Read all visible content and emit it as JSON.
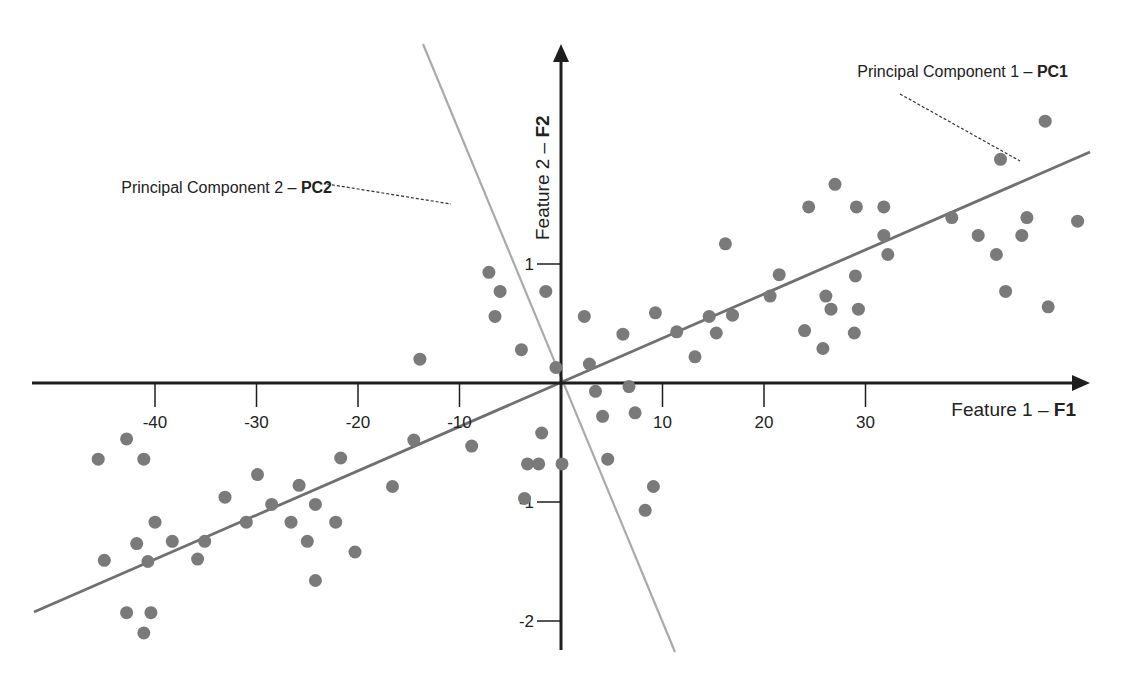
{
  "chart_data": {
    "type": "scatter",
    "title": "",
    "xlabel": "Feature 1 – F1",
    "xlabel_plain": "Feature 1 – ",
    "xlabel_bold": "F1",
    "ylabel": "Feature 2 – F2",
    "ylabel_plain": "Feature 2 – ",
    "ylabel_bold": "F2",
    "x_ticks": [
      -40,
      -30,
      -20,
      -10,
      10,
      20,
      30
    ],
    "x_tick_labels": [
      "-40",
      "-30",
      "-20",
      "-10",
      "10",
      "20",
      "30"
    ],
    "y_ticks": [
      1,
      -1,
      -2
    ],
    "y_tick_labels": [
      "1",
      "-1",
      "-2"
    ],
    "xlim": [
      -52,
      52
    ],
    "ylim": [
      -2.3,
      2.8
    ],
    "grid": false,
    "legend": null,
    "annotations": [
      {
        "text": "Principal Component 1 – PC1",
        "plain": "Principal Component 1 – ",
        "bold": "PC1",
        "points_to": "PC1 line, upper right"
      },
      {
        "text": "Principal Component 2 – PC2",
        "plain": "Principal Component 2 – ",
        "bold": "PC2",
        "points_to": "PC2 line, upper left"
      }
    ],
    "lines": [
      {
        "name": "PC1",
        "slope_per_unit": 0.04,
        "from": [
          -52,
          -1.9
        ],
        "to": [
          52,
          1.9
        ],
        "color": "#6e6e6e"
      },
      {
        "name": "PC2",
        "from": [
          -18.2,
          2.85
        ],
        "to": [
          10.8,
          -2.3
        ],
        "color": "#a8a8a8"
      }
    ],
    "series": [
      {
        "name": "samples",
        "color": "#7a7a7a",
        "points": [
          [
            -45.6,
            -0.64
          ],
          [
            -42.8,
            -0.47
          ],
          [
            -41.1,
            -0.64
          ],
          [
            -45.0,
            -1.49
          ],
          [
            -41.8,
            -1.35
          ],
          [
            -40.0,
            -1.17
          ],
          [
            -38.3,
            -1.33
          ],
          [
            -35.8,
            -1.48
          ],
          [
            -35.1,
            -1.33
          ],
          [
            -40.7,
            -1.5
          ],
          [
            -42.8,
            -1.93
          ],
          [
            -40.4,
            -1.93
          ],
          [
            -41.1,
            -2.1
          ],
          [
            -33.1,
            -0.96
          ],
          [
            -31.0,
            -1.17
          ],
          [
            -29.9,
            -0.77
          ],
          [
            -28.5,
            -1.02
          ],
          [
            -26.6,
            -1.17
          ],
          [
            -25.8,
            -0.86
          ],
          [
            -25.0,
            -1.33
          ],
          [
            -24.2,
            -1.02
          ],
          [
            -24.2,
            -1.66
          ],
          [
            -22.2,
            -1.17
          ],
          [
            -21.7,
            -0.63
          ],
          [
            -20.3,
            -1.42
          ],
          [
            -16.6,
            -0.87
          ],
          [
            -14.5,
            -0.48
          ],
          [
            -13.9,
            0.2
          ],
          [
            -8.8,
            -0.53
          ],
          [
            -7.1,
            0.93
          ],
          [
            -6.0,
            0.77
          ],
          [
            -6.5,
            0.56
          ],
          [
            -3.6,
            -0.97
          ],
          [
            -3.3,
            -0.68
          ],
          [
            -3.9,
            0.28
          ],
          [
            -1.5,
            0.77
          ],
          [
            -0.5,
            0.13
          ],
          [
            -1.9,
            -0.42
          ],
          [
            -2.2,
            -0.68
          ],
          [
            0.1,
            -0.68
          ],
          [
            2.3,
            0.56
          ],
          [
            2.8,
            0.16
          ],
          [
            3.4,
            -0.07
          ],
          [
            4.1,
            -0.28
          ],
          [
            4.6,
            -0.64
          ],
          [
            6.1,
            0.41
          ],
          [
            6.7,
            -0.03
          ],
          [
            7.3,
            -0.25
          ],
          [
            8.3,
            -1.07
          ],
          [
            9.1,
            -0.87
          ],
          [
            9.3,
            0.59
          ],
          [
            11.4,
            0.43
          ],
          [
            13.2,
            0.22
          ],
          [
            14.6,
            0.56
          ],
          [
            15.3,
            0.42
          ],
          [
            16.2,
            1.17
          ],
          [
            16.9,
            0.57
          ],
          [
            20.6,
            0.73
          ],
          [
            21.5,
            0.91
          ],
          [
            24.0,
            0.44
          ],
          [
            24.4,
            1.48
          ],
          [
            25.8,
            0.29
          ],
          [
            26.1,
            0.73
          ],
          [
            26.6,
            0.62
          ],
          [
            27.0,
            1.67
          ],
          [
            28.9,
            0.42
          ],
          [
            29.1,
            1.48
          ],
          [
            29.0,
            0.9
          ],
          [
            29.3,
            0.62
          ],
          [
            31.8,
            1.48
          ],
          [
            32.2,
            1.08
          ],
          [
            31.8,
            1.24
          ],
          [
            38.5,
            1.39
          ],
          [
            41.1,
            1.24
          ],
          [
            42.9,
            1.08
          ],
          [
            43.8,
            0.77
          ],
          [
            43.3,
            1.88
          ],
          [
            45.4,
            1.24
          ],
          [
            45.9,
            1.39
          ],
          [
            47.7,
            2.2
          ],
          [
            48.0,
            0.64
          ],
          [
            50.9,
            1.36
          ]
        ]
      }
    ]
  }
}
